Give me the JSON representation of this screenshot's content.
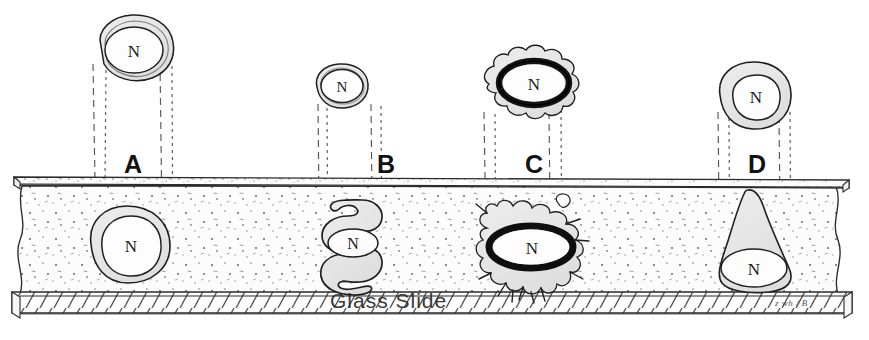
{
  "figure": {
    "background_color": "#ffffff",
    "ink_color": "#1a1a1a",
    "cytoplasm_fill": "#e9e9e9",
    "nucleus_fill": "#fdfdfd",
    "medium_fill": "#fbfbfb",
    "slide_fill": "#fcfcfc"
  },
  "labels": [
    {
      "id": "A",
      "text": "A",
      "x": 124,
      "y": 152
    },
    {
      "id": "B",
      "text": "B",
      "x": 377,
      "y": 152
    },
    {
      "id": "C",
      "text": "C",
      "x": 525,
      "y": 152
    },
    {
      "id": "D",
      "text": "D",
      "x": 748,
      "y": 152
    }
  ],
  "slide": {
    "caption": "Glass Slide",
    "caption_x": 330,
    "caption_y": 290,
    "signature": "z wh / B"
  },
  "nucleus_label": "N",
  "cells": [
    {
      "id": "A",
      "label": "A",
      "top_view": {
        "shape": "rounded-irregular-blob",
        "nucleus": "N",
        "cx": 133,
        "cy": 52
      },
      "side_view": {
        "shape": "flattened-round-spread",
        "nucleus": "N",
        "cx": 127,
        "cy": 245
      }
    },
    {
      "id": "B",
      "label": "B",
      "top_view": {
        "shape": "small-round",
        "nucleus": "N",
        "cx": 339,
        "cy": 88
      },
      "side_view": {
        "shape": "convoluted-folded-serpentine",
        "nucleus": "N",
        "cx": 352,
        "cy": 248
      }
    },
    {
      "id": "C",
      "label": "C",
      "top_view": {
        "shape": "ruffled-stellate-thick-envelope",
        "nucleus": "N",
        "cx": 538,
        "cy": 85
      },
      "side_view": {
        "shape": "spiky-stellate-thick-envelope",
        "nucleus": "N",
        "cx": 533,
        "cy": 245
      }
    },
    {
      "id": "D",
      "label": "D",
      "top_view": {
        "shape": "round-smooth",
        "nucleus": "N",
        "cx": 757,
        "cy": 96
      },
      "side_view": {
        "shape": "cone-teardrop-upright",
        "nucleus": "N",
        "cx": 754,
        "cy": 250
      }
    }
  ],
  "projection_lines": {
    "style": "vertical dashed",
    "columns": [
      {
        "for": "A",
        "x_positions": [
          92,
          105,
          160,
          172
        ]
      },
      {
        "for": "B",
        "x_positions": [
          317,
          326,
          372,
          380
        ]
      },
      {
        "for": "C",
        "x_positions": [
          483,
          494,
          549,
          560
        ]
      },
      {
        "for": "D",
        "x_positions": [
          717,
          728,
          779,
          789
        ]
      }
    ]
  }
}
